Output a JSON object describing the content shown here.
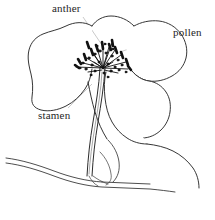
{
  "figure": {
    "name": "flower-line-drawing",
    "background_color": "#ffffff",
    "ink_color": "#1a1a1a",
    "leader_color": "#b9b9b9"
  },
  "labels": {
    "anther": "anther",
    "pollen": "pollen",
    "stamen": "stamen"
  },
  "parts": {
    "petal_upper_left": "petal-upper-left",
    "petal_upper_right": "petal-upper-right",
    "petal_lower_right": "petal-lower-right",
    "petal_lower_center": "petal-lower-center",
    "stamen_cluster": "stamen-cluster",
    "stem": "stem",
    "ground_line": "ground-line"
  }
}
